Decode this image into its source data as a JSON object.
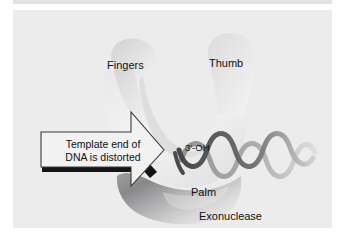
{
  "figure": {
    "kind": "biology-diagram",
    "background_color": "#ffffff",
    "panel_color": "#ececed",
    "rule_color": "#e3e3e3"
  },
  "labels": {
    "fingers": "Fingers",
    "thumb": "Thumb",
    "palm": "Palm",
    "exonuclease": "Exonuclease",
    "three_prime_oh": "3'-OH"
  },
  "callout": {
    "line1": "Template end of",
    "line2": "DNA is distorted",
    "box_fill": "#f2f2f2",
    "box_stroke": "#3a3a3a",
    "shadow_color": "#1a1a1a"
  },
  "shapes": {
    "enzyme_fill_light": "#e2e2e3",
    "enzyme_fill_mid": "#d6d6d7",
    "exonuclease_fill_dark": "#7e7e80",
    "exonuclease_fill_light": "#dcdcdd",
    "dna_strand_dark": "#4b4b4d",
    "dna_strand_light": "#b9b9bb",
    "template_bar": "#141414"
  }
}
